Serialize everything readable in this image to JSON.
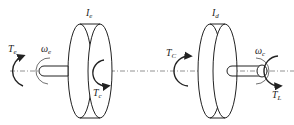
{
  "diagram": {
    "type": "two-inertia drivetrain schematic",
    "left_body": {
      "inertia_label": "I",
      "inertia_sub": "e",
      "input_torque": "T",
      "input_torque_sub": "e",
      "speed": "ω",
      "speed_sub": "e",
      "reaction_torque": "T",
      "reaction_torque_sub": "c"
    },
    "right_body": {
      "inertia_label": "I",
      "inertia_sub": "d",
      "coupling_torque": "T",
      "coupling_torque_sub": "C",
      "speed": "ω",
      "speed_sub": "c",
      "load_torque": "T",
      "load_torque_sub": "L"
    },
    "colors": {
      "stroke": "#222222",
      "axis": "#777777",
      "background": "#ffffff"
    }
  }
}
